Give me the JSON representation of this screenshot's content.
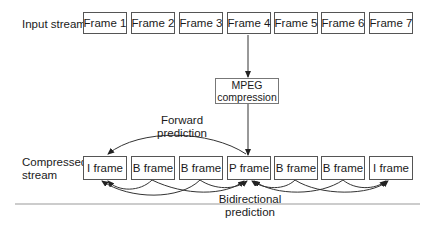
{
  "input_label": "Input stream",
  "input_frames": [
    "Frame 1",
    "Frame 2",
    "Frame 3",
    "Frame 4",
    "Frame 5",
    "Frame 6",
    "Frame 7"
  ],
  "process": {
    "line1": "MPEG",
    "line2": "compression"
  },
  "forward": {
    "line1": "Forward",
    "line2": "prediction"
  },
  "compressed_label": {
    "line1": "Compressed",
    "line2": "stream"
  },
  "compressed_frames": [
    "I frame",
    "B frame",
    "B frame",
    "P frame",
    "B frame",
    "B frame",
    "I frame"
  ],
  "bidirectional": {
    "line1": "Bidirectional",
    "line2": "prediction"
  }
}
